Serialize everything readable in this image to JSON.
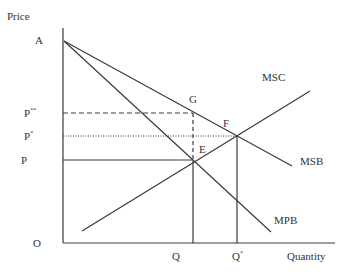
{
  "diagram": {
    "axes": {
      "y_label": "Price",
      "x_label": "Quantity",
      "origin_label": "O"
    },
    "price_labels": {
      "a": "A",
      "p_double_star": "P",
      "p_double_star_sup": "**",
      "p_star": "P",
      "p_star_sup": "*",
      "p": "P"
    },
    "quantity_labels": {
      "q": "Q",
      "q_star": "Q",
      "q_star_sup": "*"
    },
    "curves": {
      "msc": "MSC",
      "msb": "MSB",
      "mpb": "MPB"
    },
    "points": {
      "e": "E",
      "f": "F",
      "g": "G"
    },
    "colors": {
      "line": "#3a3a3a",
      "text": "#333333"
    }
  }
}
